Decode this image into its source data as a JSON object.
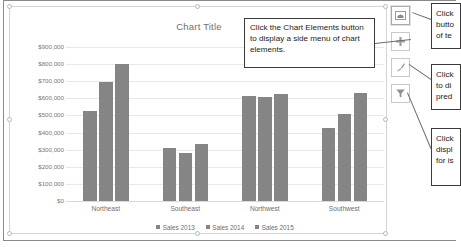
{
  "app": "excel-chart-editor",
  "chart_object": {
    "selected": true,
    "title": "Chart Title"
  },
  "side_buttons": [
    {
      "name": "chart-area-button",
      "icon": "chart-area-icon",
      "glyph": "selected-chart",
      "active": true
    },
    {
      "name": "chart-elements-button",
      "icon": "plus-icon",
      "glyph": "+",
      "active": false
    },
    {
      "name": "chart-styles-button",
      "icon": "paintbrush-icon",
      "glyph": "brush",
      "active": false
    },
    {
      "name": "chart-filters-button",
      "icon": "funnel-filter-icon",
      "glyph": "funnel",
      "active": false
    }
  ],
  "callouts": {
    "main": "Click the Chart Elements button to display a side menu of chart elements.",
    "right": [
      {
        "id": "callout-styles-cropped",
        "lines": [
          "Click",
          "butto",
          "of te"
        ]
      },
      {
        "id": "callout-brush-cropped",
        "lines": [
          "Click",
          "to di",
          "pred"
        ]
      },
      {
        "id": "callout-filter-cropped",
        "lines": [
          "Click",
          "displ",
          "for is"
        ]
      }
    ]
  },
  "chart_data": {
    "type": "bar",
    "title": "Chart Title",
    "xlabel": "",
    "ylabel": "",
    "ylim": [
      0,
      900000
    ],
    "ytick_values": [
      0,
      100000,
      200000,
      300000,
      400000,
      500000,
      600000,
      700000,
      800000,
      900000
    ],
    "ytick_labels": [
      "$0",
      "$100,000",
      "$200,000",
      "$300,000",
      "$400,000",
      "$500,000",
      "$600,000",
      "$700,000",
      "$800,000",
      "$900,000"
    ],
    "categories": [
      "Northeast",
      "Southeast",
      "Northwest",
      "Southwest"
    ],
    "series": [
      {
        "name": "Sales 2013",
        "color": "#858585",
        "values": [
          525000,
          310000,
          615000,
          425000
        ]
      },
      {
        "name": "Sales 2014",
        "color": "#858585",
        "values": [
          695000,
          280000,
          605000,
          508000
        ]
      },
      {
        "name": "Sales 2015",
        "color": "#858585",
        "values": [
          800000,
          335000,
          628000,
          633000
        ]
      }
    ],
    "grid": true,
    "legend_position": "bottom"
  },
  "colors": {
    "bar": "#858585",
    "gridline": "#e9e9e9",
    "axis_text": "#6e6e6e",
    "title_text": "#6f6f6f",
    "callout_border": "#3a3a3a"
  }
}
